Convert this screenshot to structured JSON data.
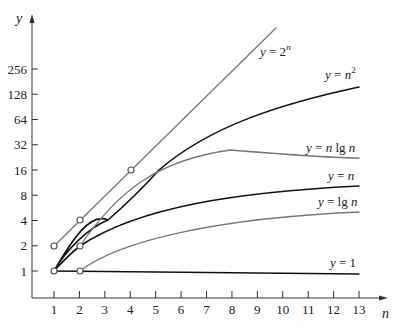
{
  "chart_data": {
    "type": "line",
    "title": "",
    "xlabel": "n",
    "ylabel": "y",
    "yscale": "log2",
    "grid": false,
    "legend": "inline labels at right end of curves",
    "x_ticks": [
      "1",
      "2",
      "3",
      "4",
      "5",
      "6",
      "7",
      "8",
      "9",
      "10",
      "11",
      "12",
      "13"
    ],
    "y_ticks": [
      "1",
      "2",
      "4",
      "8",
      "16",
      "32",
      "64",
      "128",
      "256"
    ],
    "xlim": [
      1,
      13
    ],
    "ylim": [
      1,
      256
    ],
    "series": [
      {
        "name": "y = 2^n",
        "label_main": "y = 2",
        "label_sup": "n",
        "color": "#777777",
        "x": [
          1,
          2,
          3,
          4,
          5,
          6,
          7,
          8
        ],
        "y": [
          2,
          4,
          8,
          16,
          32,
          64,
          128,
          256
        ]
      },
      {
        "name": "y = n^2",
        "label_main": "y = n",
        "label_sup": "2",
        "color": "#111111",
        "x": [
          1,
          2,
          3,
          4,
          5,
          6,
          7,
          8,
          9,
          10,
          11,
          12,
          13
        ],
        "y": [
          1,
          4,
          9,
          16,
          25,
          36,
          49,
          64,
          81,
          100,
          121,
          144,
          169
        ]
      },
      {
        "name": "y = n lg n",
        "label_main": "y = n lg n",
        "color": "#777777",
        "x": [
          2,
          3,
          4,
          5,
          6,
          7,
          8,
          9,
          10,
          11,
          12,
          13
        ],
        "y": [
          2,
          4.75,
          8,
          11.6,
          15.5,
          19.7,
          24,
          28.5,
          33.2,
          38.1,
          43,
          48.1
        ]
      },
      {
        "name": "y = n",
        "label_main": "y = n",
        "color": "#111111",
        "x": [
          1,
          2,
          3,
          4,
          5,
          6,
          7,
          8,
          9,
          10,
          11,
          12,
          13
        ],
        "y": [
          1,
          2,
          3,
          4,
          5,
          6,
          7,
          8,
          9,
          10,
          11,
          12,
          13
        ]
      },
      {
        "name": "y = lg n",
        "label_main": "y = lg n",
        "color": "#777777",
        "x": [
          2,
          3,
          4,
          5,
          6,
          7,
          8,
          9,
          10,
          11,
          12,
          13
        ],
        "y": [
          1,
          1.58,
          2,
          2.32,
          2.58,
          2.81,
          3,
          3.17,
          3.32,
          3.46,
          3.58,
          3.7
        ]
      },
      {
        "name": "y = 1",
        "label_main": "y = 1",
        "color": "#111111",
        "x": [
          1,
          13
        ],
        "y": [
          1,
          1
        ]
      }
    ],
    "annotations": [
      {
        "type": "open-circle-marker",
        "points": [
          [
            1,
            1
          ],
          [
            1,
            2
          ],
          [
            2,
            1
          ],
          [
            2,
            2
          ],
          [
            2,
            4
          ],
          [
            4,
            16
          ]
        ]
      }
    ]
  }
}
